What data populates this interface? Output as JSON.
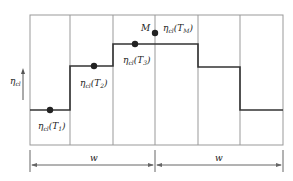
{
  "diagram": {
    "y_axis_label": "η",
    "y_axis_label_sub": "cl",
    "peak_point_label": "M",
    "points": [
      {
        "eta": "η",
        "sub": "cl",
        "arg": "T",
        "arg_sub": "1"
      },
      {
        "eta": "η",
        "sub": "cl",
        "arg": "T",
        "arg_sub": "2"
      },
      {
        "eta": "η",
        "sub": "cl",
        "arg": "T",
        "arg_sub": "3"
      },
      {
        "eta": "η",
        "sub": "cl",
        "arg": "T",
        "arg_sub": "M"
      }
    ],
    "dimension_labels": [
      "w",
      "w"
    ]
  }
}
